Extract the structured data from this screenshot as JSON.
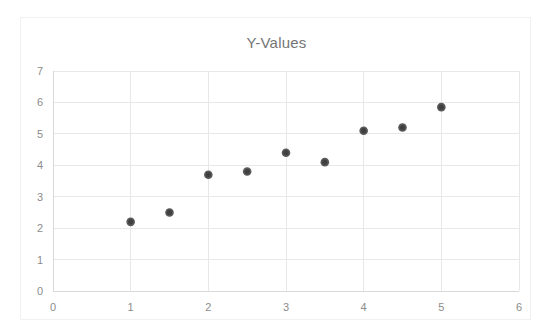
{
  "chart_data": {
    "type": "scatter",
    "title": "Y-Values",
    "xlabel": "",
    "ylabel": "",
    "xlim": [
      0,
      6
    ],
    "ylim": [
      0,
      7
    ],
    "x_ticks": [
      0,
      1,
      2,
      3,
      4,
      5,
      6
    ],
    "y_ticks": [
      0,
      1,
      2,
      3,
      4,
      5,
      6,
      7
    ],
    "grid": true,
    "legend": false,
    "marker_color": "#404040",
    "gridline_color": "#e8e8e8",
    "title_color": "#757575",
    "tick_color": "#8c8c8c",
    "series": [
      {
        "name": "Y-Values",
        "x": [
          1,
          1.5,
          2,
          2.5,
          3,
          3.5,
          4,
          4.5,
          5
        ],
        "y": [
          2.2,
          2.5,
          3.7,
          3.8,
          4.4,
          4.1,
          5.1,
          5.2,
          5.85
        ]
      }
    ],
    "points": [
      {
        "x": 1,
        "y": 2.2
      },
      {
        "x": 1.5,
        "y": 2.5
      },
      {
        "x": 2,
        "y": 3.7
      },
      {
        "x": 2.5,
        "y": 3.8
      },
      {
        "x": 3,
        "y": 4.4
      },
      {
        "x": 3.5,
        "y": 4.1
      },
      {
        "x": 4,
        "y": 5.1
      },
      {
        "x": 4.5,
        "y": 5.2
      },
      {
        "x": 5,
        "y": 5.85
      }
    ]
  }
}
